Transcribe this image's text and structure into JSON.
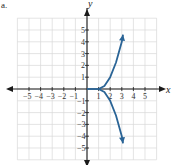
{
  "panel_label": "a.",
  "colors": {
    "curve": "#2a6496",
    "grid": "#d9d9d9",
    "axis": "#1a1a1a"
  },
  "chart_data": {
    "type": "line",
    "title": "",
    "xlabel": "x",
    "ylabel": "y",
    "xlim": [
      -6,
      6
    ],
    "ylim": [
      -6,
      6
    ],
    "grid": true,
    "x_ticks": [
      -5,
      -4,
      -3,
      -2,
      -1,
      1,
      2,
      3,
      4,
      5
    ],
    "y_ticks": [
      5,
      4,
      3,
      2,
      1,
      -1,
      -2,
      -3,
      -4,
      -5
    ],
    "series": [
      {
        "name": "horizontal segment",
        "points": [
          [
            0,
            0
          ],
          [
            1,
            0
          ]
        ]
      },
      {
        "name": "upper branch",
        "points": [
          [
            1,
            0
          ],
          [
            1.5,
            0.25
          ],
          [
            2,
            1
          ],
          [
            2.5,
            2.25
          ],
          [
            3,
            4
          ],
          [
            3.1,
            4.6
          ]
        ],
        "arrow_end": true
      },
      {
        "name": "lower branch",
        "points": [
          [
            1,
            0
          ],
          [
            1.5,
            -0.25
          ],
          [
            2,
            -1
          ],
          [
            2.5,
            -2.25
          ],
          [
            3,
            -4
          ],
          [
            3.1,
            -4.6
          ]
        ],
        "arrow_end": true
      }
    ]
  }
}
